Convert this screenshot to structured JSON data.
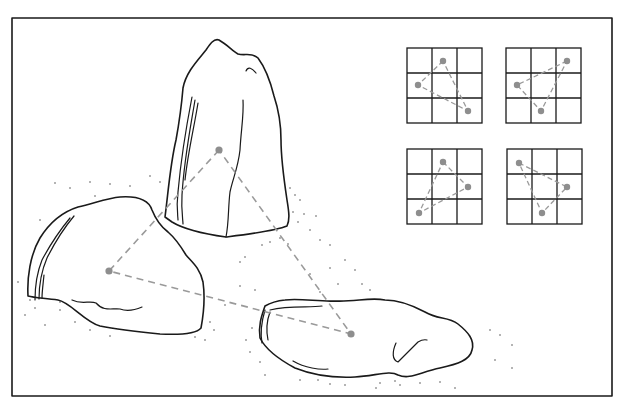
{
  "diagram": {
    "type": "rock-garden-triangle-composition",
    "frame": {
      "x": 12,
      "y": 18,
      "width": 600,
      "height": 378
    },
    "colors": {
      "ink": "#1a1a1a",
      "dashes": "#9a9a9a",
      "dots": "#8e8e8e",
      "background": "#ffffff"
    },
    "rocks": [
      {
        "name": "tall-upright-rock",
        "outline": "M165,217 C168,195 170,165 176,140 C180,118 182,100 183,88 C186,72 198,60 206,50 C210,44 214,38 219,40 C226,44 232,50 238,54 C245,56 252,52 258,58 C264,66 270,80 274,96 C278,108 281,125 281,140 C281,160 284,180 287,200 C289,212 290,220 287,226 C275,231 250,234 226,237 C205,234 185,230 172,222 Z",
        "strata": [
          "M195,100 C190,130 184,160 182,195 C181,210 183,220 183,224",
          "M192,97 C186,128 181,158 178,192 C176,208 178,216 178,220",
          "M198,103 C194,128 188,152 185,180"
        ],
        "cracks": [
          "M243,100 C244,115 241,130 240,150 C238,168 233,178 230,192 C228,208 229,222 226,237",
          "M246,71 C248,66 252,68 256,73"
        ]
      },
      {
        "name": "low-left-rock",
        "outline": "M28,296 C27,278 30,255 40,238 C50,222 62,212 78,207 C95,203 108,198 120,197 C135,196 148,198 152,210 C156,220 160,226 168,232 C175,238 180,245 186,255 C192,262 200,268 203,282 C205,296 204,312 201,328 C196,334 180,335 160,334 C140,332 120,330 100,326 C85,322 70,302 58,300 C45,298 35,298 28,296 Z",
        "strata": [
          "M70,218 C60,230 50,245 42,260 C36,275 35,290 35,300",
          "M74,216 C64,228 55,242 47,258 C41,272 39,287 39,299",
          "M44,275 C43,285 42,292 42,298"
        ],
        "cracks": [
          "M72,300 C82,305 90,300 96,303 C104,312 112,308 120,309 C128,312 135,310 142,307"
        ]
      },
      {
        "name": "flat-lying-rock",
        "outline": "M265,306 C262,315 258,325 260,338 C266,350 280,360 295,368 C315,376 335,378 355,377 C375,376 390,370 398,375 C410,380 420,372 440,368 C458,364 470,360 472,350 C475,340 468,332 458,324 C448,316 438,320 425,312 C410,304 398,300 385,300 C370,297 355,302 335,301 C320,302 300,298 285,300 C275,301 270,303 265,306 Z",
        "strata": [
          "M265,310 C262,320 260,332 262,343",
          "M270,312 C267,320 266,330 268,340",
          "M270,310 C290,305 310,308 322,306"
        ],
        "cracks": [
          "M293,361 C305,368 320,370 328,369",
          "M396,343 C392,352 392,360 398,362 C404,356 410,350 418,342 C423,339 427,340 427,340"
        ]
      }
    ],
    "triangle": {
      "points": [
        {
          "x": 219,
          "y": 150
        },
        {
          "x": 109,
          "y": 271
        },
        {
          "x": 351,
          "y": 334
        }
      ]
    },
    "grids": [
      {
        "x": 407,
        "y": 48,
        "size": 75,
        "points": [
          {
            "x": 443,
            "y": 61
          },
          {
            "x": 418,
            "y": 85
          },
          {
            "x": 468,
            "y": 111
          }
        ]
      },
      {
        "x": 506,
        "y": 48,
        "size": 75,
        "points": [
          {
            "x": 567,
            "y": 61
          },
          {
            "x": 517,
            "y": 85
          },
          {
            "x": 541,
            "y": 111
          }
        ]
      },
      {
        "x": 407,
        "y": 149,
        "size": 75,
        "points": [
          {
            "x": 443,
            "y": 162
          },
          {
            "x": 468,
            "y": 187
          },
          {
            "x": 419,
            "y": 213
          }
        ]
      },
      {
        "x": 507,
        "y": 149,
        "size": 75,
        "points": [
          {
            "x": 519,
            "y": 163
          },
          {
            "x": 567,
            "y": 187
          },
          {
            "x": 542,
            "y": 213
          }
        ]
      }
    ],
    "grains": [
      [
        55,
        183
      ],
      [
        70,
        188
      ],
      [
        90,
        182
      ],
      [
        110,
        184
      ],
      [
        150,
        176
      ],
      [
        160,
        182
      ],
      [
        130,
        186
      ],
      [
        95,
        196
      ],
      [
        40,
        220
      ],
      [
        30,
        300
      ],
      [
        25,
        315
      ],
      [
        45,
        325
      ],
      [
        60,
        310
      ],
      [
        75,
        322
      ],
      [
        90,
        330
      ],
      [
        110,
        336
      ],
      [
        200,
        310
      ],
      [
        210,
        322
      ],
      [
        214,
        330
      ],
      [
        195,
        337
      ],
      [
        205,
        340
      ],
      [
        225,
        305
      ],
      [
        240,
        286
      ],
      [
        255,
        290
      ],
      [
        290,
        188
      ],
      [
        295,
        195
      ],
      [
        300,
        200
      ],
      [
        293,
        212
      ],
      [
        298,
        222
      ],
      [
        304,
        214
      ],
      [
        310,
        230
      ],
      [
        320,
        240
      ],
      [
        330,
        245
      ],
      [
        316,
        216
      ],
      [
        345,
        260
      ],
      [
        338,
        284
      ],
      [
        330,
        268
      ],
      [
        362,
        284
      ],
      [
        355,
        270
      ],
      [
        370,
        290
      ],
      [
        310,
        274
      ],
      [
        320,
        292
      ],
      [
        245,
        257
      ],
      [
        240,
        262
      ],
      [
        262,
        245
      ],
      [
        270,
        242
      ],
      [
        280,
        238
      ],
      [
        288,
        244
      ],
      [
        490,
        330
      ],
      [
        500,
        335
      ],
      [
        512,
        345
      ],
      [
        495,
        360
      ],
      [
        512,
        368
      ],
      [
        440,
        382
      ],
      [
        380,
        383
      ],
      [
        376,
        388
      ],
      [
        318,
        380
      ],
      [
        330,
        384
      ],
      [
        300,
        380
      ],
      [
        260,
        362
      ],
      [
        250,
        352
      ],
      [
        246,
        340
      ],
      [
        252,
        328
      ],
      [
        265,
        375
      ],
      [
        400,
        385
      ],
      [
        395,
        381
      ],
      [
        420,
        383
      ],
      [
        455,
        388
      ],
      [
        345,
        385
      ],
      [
        60,
        302
      ],
      [
        35,
        308
      ],
      [
        18,
        282
      ]
    ]
  }
}
